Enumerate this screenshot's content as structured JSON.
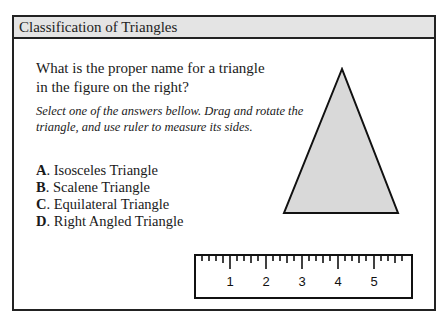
{
  "header": {
    "title": "Classification of Triangles"
  },
  "question": {
    "text": "What is the proper name for a triangle in the figure on the right?"
  },
  "instructions": {
    "text": "Select one of the answers bellow. Drag and rotate the triangle, and use ruler to measure its sides."
  },
  "answers": [
    {
      "letter": "A",
      "label": ". Isosceles Triangle"
    },
    {
      "letter": "B",
      "label": ". Scalene Triangle"
    },
    {
      "letter": "C",
      "label": ". Equilateral Triangle"
    },
    {
      "letter": "D",
      "label": ". Right Angled Triangle"
    }
  ],
  "triangle": {
    "fill": "#d9d9d9",
    "stroke": "#111111"
  },
  "ruler": {
    "labels": [
      "1",
      "2",
      "3",
      "4",
      "5"
    ]
  }
}
